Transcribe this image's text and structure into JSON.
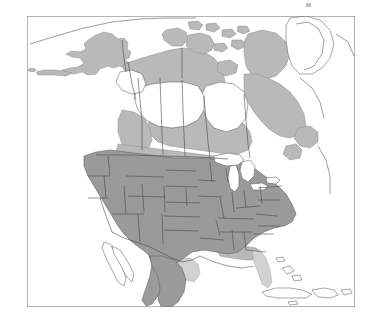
{
  "figure": {
    "type": "distribution-range-map",
    "region": "North America",
    "frame": {
      "x": 27,
      "y": 16,
      "width": 328,
      "height": 291,
      "stroke": "#6b6b6b",
      "stroke_width": 1,
      "fill": "#ffffff"
    },
    "colors": {
      "background": "#ffffff",
      "ocean": "#ffffff",
      "range_core": "#9a9a9a",
      "range_extended": "#b9b9b9",
      "range_marginal": "#d2d2d2",
      "unshaded_land": "#ffffff",
      "coastline": "#5d5d5d",
      "political_border": "#4a4a4a",
      "frame_line": "#6b6b6b"
    },
    "legend_entries": [
      {
        "label": "core range",
        "color": "#9a9a9a"
      },
      {
        "label": "extended range",
        "color": "#b9b9b9"
      },
      {
        "label": "marginal range",
        "color": "#d2d2d2"
      },
      {
        "label": "outside range",
        "color": "#ffffff"
      }
    ],
    "features": [
      {
        "name": "alaska",
        "shading": "range_extended"
      },
      {
        "name": "aleutian-islands",
        "shading": "range_extended"
      },
      {
        "name": "yukon-northwest-territories",
        "shading": "range_extended"
      },
      {
        "name": "canadian-arctic-archipelago",
        "shading": "range_extended"
      },
      {
        "name": "central-canadian-prairies",
        "shading": "unshaded_land"
      },
      {
        "name": "hudson-bay",
        "shading": "ocean"
      },
      {
        "name": "quebec-labrador",
        "shading": "range_extended"
      },
      {
        "name": "greenland",
        "shading": "unshaded_land"
      },
      {
        "name": "great-lakes",
        "shading": "ocean"
      },
      {
        "name": "conterminous-united-states",
        "shading": "range_core"
      },
      {
        "name": "florida",
        "shading": "range_marginal"
      },
      {
        "name": "northern-mexico",
        "shading": "range_core"
      },
      {
        "name": "baja-california",
        "shading": "unshaded_land"
      },
      {
        "name": "cuba",
        "shading": "unshaded_land"
      },
      {
        "name": "hispaniola",
        "shading": "unshaded_land"
      },
      {
        "name": "bahamas",
        "shading": "unshaded_land"
      }
    ],
    "artifact": {
      "name": "scan-artifact",
      "visible": true,
      "x": 306,
      "y": 3
    }
  }
}
